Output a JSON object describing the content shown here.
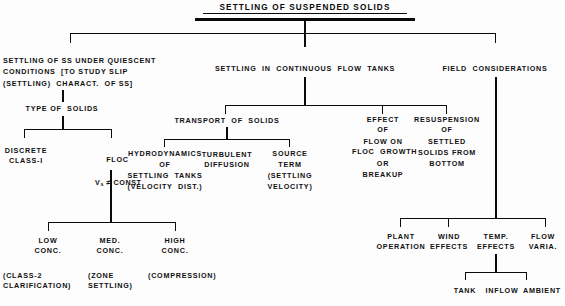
{
  "diagram": {
    "type": "hierarchy-flowchart",
    "title": "SETTLING OF SUSPENDED SOLIDS",
    "nodes": {
      "root": "SETTLING OF SUSPENDED SOLIDS",
      "quiescent": "SETTLING OF SS UNDER QUIESCENT\nCONDITIONS  [TO STUDY SLIP\n(SETTLING)  CHARACT.  OF SS]",
      "continuous_flow": "SETTLING  IN  CONTINUOUS  FLOW  TANKS",
      "field": "FIELD  CONSIDERATIONS",
      "type_of_solids": "TYPE OF  SOLIDS",
      "discrete": "DISCRETE\nCLASS-I",
      "floc_line1": "FLOC",
      "floc_line2_prefix": "V",
      "floc_line2_sub": "s",
      "floc_line2_suffix": "≠ CONST",
      "transport": "TRANSPORT  OF  SOLIDS",
      "hydrodynamics": "HYDRODYNAMICS\nOF\nSETTLING  TANKS\n(VELOCITY  DIST.)",
      "turbulent": "TURBULENT\nDIFFUSION",
      "source_term": "SOURCE\nTERM\n(SETTLING\nVELOCITY)",
      "effect_flow": "EFFECT\nOF\nFLOW ON\nFLOC  GROWTH\nOR\nBREAKUP",
      "resuspension": "RESUSPENSION\nOF\nSETTLED\nSOLIDS FROM\nBOTTOM",
      "low_conc": "LOW\nCONC.",
      "med_conc": "MED.\nCONC.",
      "high_conc": "HIGH\nCONC.",
      "low_conc_note": "(CLASS-2\nCLARIFICATION)",
      "med_conc_note": "(ZONE\nSETTLING)",
      "high_conc_note": "(COMPRESSION)",
      "plant_operation": "PLANT\nOPERATION",
      "wind_effects": "WIND\nEFFECTS",
      "temp_effects": "TEMP.\nEFFECTS",
      "flow_varia": "FLOW\nVARIA.",
      "tank": "TANK",
      "inflow": "INFLOW",
      "ambient": "AMBIENT"
    },
    "colors": {
      "ink": "#0b0b0b",
      "paper": "#fdfdfd"
    }
  }
}
